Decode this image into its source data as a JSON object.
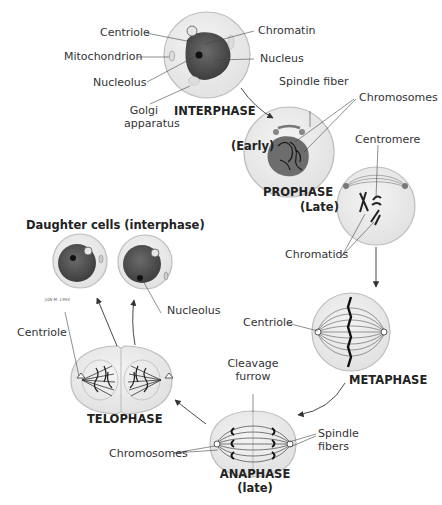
{
  "diagram": {
    "type": "cell-cycle-mitosis",
    "colors": {
      "cell_fill": "#ececec",
      "cell_border": "#bdbdbd",
      "nucleus_fill": "#5a5a5a",
      "line": "#333333",
      "text": "#333333"
    },
    "stages": {
      "interphase": {
        "label": "INTERPHASE"
      },
      "prophase": {
        "label": "PROPHASE",
        "early": "(Early)",
        "late": "(Late)"
      },
      "metaphase": {
        "label": "METAPHASE"
      },
      "anaphase": {
        "label": "ANAPHASE",
        "sub": "(late)"
      },
      "telophase": {
        "label": "TELOPHASE"
      },
      "daughter": {
        "label": "Daughter cells (interphase)"
      }
    },
    "labels": {
      "centriole_interphase": "Centriole",
      "mitochondrion": "Mitochondrion",
      "nucleolus_interphase": "Nucleolus",
      "golgi_line1": "Golgi",
      "golgi_line2": "apparatus",
      "chromatin": "Chromatin",
      "nucleus": "Nucleus",
      "spindle_fiber": "Spindle fiber",
      "chromosomes_prophase": "Chromosomes",
      "centromere": "Centromere",
      "chromatids": "Chromatids",
      "centriole_metaphase": "Centriole",
      "cleavage_line1": "Cleavage",
      "cleavage_line2": "furrow",
      "spindle_fibers_line1": "Spindle",
      "spindle_fibers_line2": "fibers",
      "chromosomes_anaphase": "Chromosomes",
      "centriole_telophase": "Centriole",
      "nucleolus_daughter": "Nucleolus",
      "signature": "JON M. 1994"
    }
  }
}
